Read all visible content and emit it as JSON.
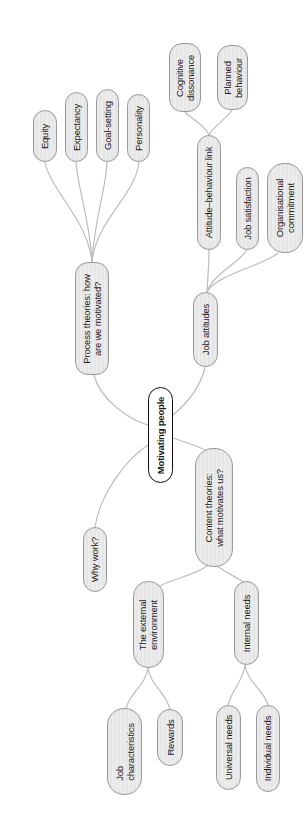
{
  "diagram": {
    "type": "mind-map",
    "orientation": "rotated-90-ccw",
    "colors": {
      "node_fill": "#e8e8e8",
      "node_border": "#9a9a9a",
      "center_fill": "#ffffff",
      "center_border": "#111111",
      "connector": "#bdbdbd",
      "text": "#1a1a1a"
    },
    "center": {
      "label": "Motivating people"
    },
    "branches": {
      "process": {
        "label": "Process theories: how\nare we motivated?",
        "children": [
          "Equity",
          "Expectancy",
          "Goal-setting",
          "Personality"
        ]
      },
      "job_attitudes": {
        "label": "Job attitudes",
        "children": {
          "attitude_link": {
            "label": "Attitude–behaviour link",
            "children": [
              "Cognitive\ndissonance",
              "Planned\nbehaviour"
            ]
          },
          "job_satisfaction": {
            "label": "Job satisfaction"
          },
          "org_commitment": {
            "label": "Organisational\ncommitment"
          }
        }
      },
      "why_work": {
        "label": "Why work?"
      },
      "content": {
        "label": "Content theories:\nwhat motivates us?",
        "children": {
          "external": {
            "label": "The external\nenvironment",
            "children": [
              "Job\ncharacteristics",
              "Rewards"
            ]
          },
          "internal": {
            "label": "Internal needs",
            "children": [
              "Universal needs",
              "Individual needs"
            ]
          }
        }
      }
    }
  }
}
